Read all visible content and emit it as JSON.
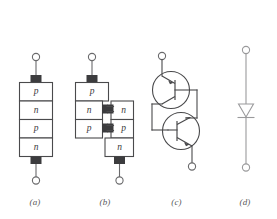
{
  "figure": {
    "background_color": "#ffffff",
    "ink_color": "#4a4a4c",
    "pad_color": "#3c3c3e",
    "lead_color": "#6a6a6c",
    "symbol_color": "#9a9a9c",
    "panels": [
      {
        "id": "panel-a",
        "caption": "(a)",
        "kind": "four-layer-structure",
        "layers": [
          {
            "label": "p"
          },
          {
            "label": "n"
          },
          {
            "label": "p"
          },
          {
            "label": "n"
          }
        ],
        "terminals": [
          "top",
          "bottom"
        ]
      },
      {
        "id": "panel-b",
        "caption": "(b)",
        "kind": "split-two-transistor-structure",
        "left_stack": [
          {
            "label": "p"
          },
          {
            "label": "n"
          },
          {
            "label": "p"
          }
        ],
        "right_stack": [
          {
            "label": "n"
          },
          {
            "label": "p"
          },
          {
            "label": "n"
          }
        ],
        "interconnects": 2,
        "terminals": [
          "top-left",
          "bottom-right"
        ]
      },
      {
        "id": "panel-c",
        "caption": "(c)",
        "kind": "two-transistor-equivalent-circuit",
        "devices": [
          {
            "name": "pnp-transistor",
            "position": "upper"
          },
          {
            "name": "npn-transistor",
            "position": "lower"
          }
        ],
        "terminals": [
          "anode-top",
          "cathode-bottom"
        ]
      },
      {
        "id": "panel-d",
        "caption": "(d)",
        "kind": "circuit-symbol",
        "symbol": "thyristor-diode-symbol",
        "terminals": [
          "top",
          "bottom"
        ]
      }
    ]
  }
}
